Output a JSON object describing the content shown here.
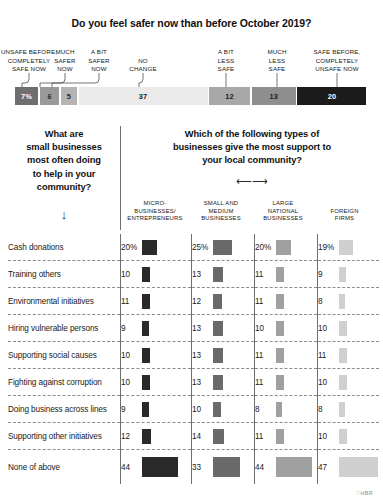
{
  "chart_data": [
    {
      "type": "bar",
      "subtype": "stacked-horizontal-100",
      "title": "Do you feel safer now than before October 2019?",
      "xlabel": "",
      "ylabel": "",
      "grid": false,
      "legend_position": "above-bar-callouts",
      "categories": [
        "UNSAFE BEFORE, COMPLETELY SAFE NOW",
        "MUCH SAFER NOW",
        "A BIT SAFER NOW",
        "NO CHANGE",
        "A BIT LESS SAFE",
        "MUCH LESS SAFE",
        "SAFE BEFORE, COMPLETELY UNSAFE NOW"
      ],
      "values": [
        7,
        6,
        5,
        37,
        12,
        13,
        20
      ],
      "value_labels": [
        "7%",
        "6",
        "5",
        "37",
        "12",
        "13",
        "20"
      ],
      "colors": [
        "#6e6e6e",
        "#9a9a9a",
        "#b4b4b4",
        "#eaeaea",
        "#a8a8a8",
        "#8e8e8e",
        "#1b1b1b"
      ],
      "label_text_colors": [
        "#ffffff",
        "#2b2b2b",
        "#2b2b2b",
        "#1a1a1a",
        "#1a1a1a",
        "#1a1a1a",
        "#ffffff"
      ]
    },
    {
      "type": "table",
      "title_left": "What are small businesses most often doing to help in your community?",
      "title_right": "Which of the following types of businesses give the most support to your local community?",
      "left_arrow_glyph": "↓",
      "right_arrow_glyph": "⟵⟶",
      "categories": [
        "Cash donations",
        "Training others",
        "Environmental initiatives",
        "Hiring vulnerable persons",
        "Supporting social causes",
        "Fighting against corruption",
        "Doing business across lines",
        "Supporting other initiatives",
        "None of above"
      ],
      "series": [
        {
          "name": "MICRO-BUSINESSES/ ENTREPRENEURS",
          "color": "#2a2a2a",
          "values": [
            20,
            10,
            11,
            9,
            10,
            10,
            9,
            12,
            44
          ],
          "value_labels": [
            "20%",
            "10",
            "11",
            "9",
            "10",
            "10",
            "9",
            "12",
            "44"
          ]
        },
        {
          "name": "SMALL AND MEDIUM BUSINESSES",
          "color": "#6a6a6a",
          "values": [
            25,
            13,
            12,
            13,
            13,
            13,
            10,
            14,
            33
          ],
          "value_labels": [
            "25%",
            "13",
            "12",
            "13",
            "13",
            "13",
            "10",
            "14",
            "33"
          ]
        },
        {
          "name": "LARGE NATIONAL BUSINESSES",
          "color": "#a0a0a0",
          "values": [
            20,
            11,
            11,
            10,
            11,
            11,
            8,
            11,
            44
          ],
          "value_labels": [
            "20%",
            "11",
            "11",
            "10",
            "11",
            "11",
            "8",
            "11",
            "44"
          ]
        },
        {
          "name": "FOREIGN FIRMS",
          "color": "#cfcfcf",
          "values": [
            19,
            9,
            8,
            10,
            11,
            10,
            8,
            10,
            47
          ],
          "value_labels": [
            "19%",
            "9",
            "8",
            "10",
            "11",
            "10",
            "8",
            "10",
            "47"
          ]
        }
      ]
    }
  ],
  "chart1": {
    "title": "Do you feel safer now than before October 2019?",
    "segments": [
      {
        "label": "UNSAFE BEFORE,\nCOMPLETELY\nSAFE NOW",
        "value_label": "7%"
      },
      {
        "label": "MUCH\nSAFER\nNOW",
        "value_label": "6"
      },
      {
        "label": "A BIT\nSAFER\nNOW",
        "value_label": "5"
      },
      {
        "label": "NO\nCHANGE",
        "value_label": "37"
      },
      {
        "label": "A BIT\nLESS\nSAFE",
        "value_label": "12"
      },
      {
        "label": "MUCH\nLESS\nSAFE",
        "value_label": "13"
      },
      {
        "label": "SAFE BEFORE,\nCOMPLETELY\nUNSAFE NOW",
        "value_label": "20"
      }
    ]
  },
  "chart2": {
    "question_left": "What are\nsmall businesses\nmost often doing\nto help in your\ncommunity?",
    "question_right": "Which of the following types of\nbusinesses give the most support to\nyour local community?",
    "arrow_lr": "⟵⟶",
    "arrow_down": "↓",
    "column_headers": [
      "MICRO-\nBUSINESSES/\nENTREPRENEURS",
      "SMALL AND\nMEDIUM\nBUSINESSES",
      "LARGE\nNATIONAL\nBUSINESSES",
      "FOREIGN\nFIRMS"
    ],
    "rows": [
      {
        "label": "Cash donations",
        "cells": [
          "20%",
          "25%",
          "20%",
          "19%"
        ]
      },
      {
        "label": "Training others",
        "cells": [
          "10",
          "13",
          "11",
          "9"
        ]
      },
      {
        "label": "Environmental initiatives",
        "cells": [
          "11",
          "12",
          "11",
          "8"
        ]
      },
      {
        "label": "Hiring vulnerable persons",
        "cells": [
          "9",
          "13",
          "10",
          "10"
        ]
      },
      {
        "label": "Supporting social causes",
        "cells": [
          "10",
          "13",
          "11",
          "11"
        ]
      },
      {
        "label": "Fighting against corruption",
        "cells": [
          "10",
          "13",
          "11",
          "10"
        ]
      },
      {
        "label": "Doing business across lines",
        "cells": [
          "9",
          "10",
          "8",
          "8"
        ]
      },
      {
        "label": "Supporting other initiatives",
        "cells": [
          "12",
          "14",
          "11",
          "10"
        ]
      },
      {
        "label": "None of above",
        "cells": [
          "44",
          "33",
          "44",
          "47"
        ]
      }
    ]
  },
  "credit": "♡HBR"
}
